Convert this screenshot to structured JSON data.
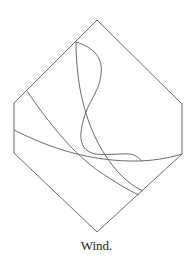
{
  "figure": {
    "caption": "Wind.",
    "stroke_color": "#6b6b6b",
    "hexagon": [
      [
        97,
        20
      ],
      [
        182,
        104
      ],
      [
        182,
        154
      ],
      [
        97,
        232
      ],
      [
        14,
        153
      ],
      [
        14,
        103
      ]
    ],
    "curves": [
      {
        "name": "s-curve",
        "d": "M76,42 C95,48 103,58 101,75 C99,92 88,102 84,118 C78,138 80,150 95,154 C110,156 128,152 134,155 C138,157 140,159 142,161"
      },
      {
        "name": "straight-curve",
        "d": "M76,42 C76,95 90,135 110,162 C120,176 132,186 143,191"
      },
      {
        "name": "diagonal-curve",
        "d": "M27,91 C50,125 75,155 100,172 C115,182 128,190 139,195"
      },
      {
        "name": "long-arc",
        "d": "M14,130 C50,148 90,162 140,161 C160,160 172,157 182,154"
      }
    ]
  }
}
